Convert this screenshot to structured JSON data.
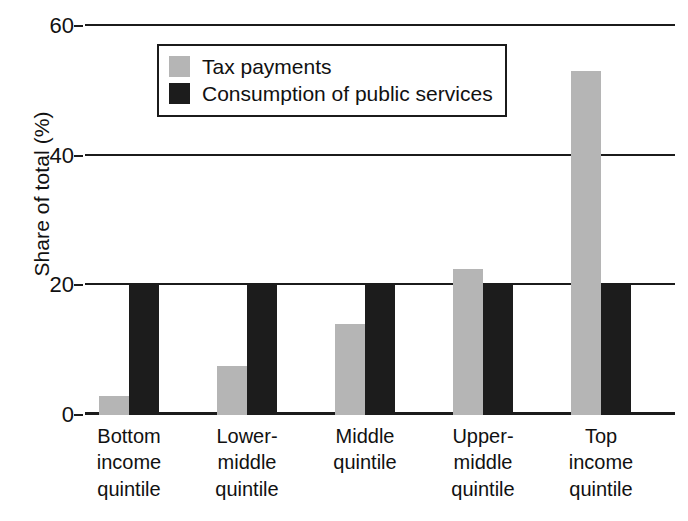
{
  "chart_data": {
    "type": "bar",
    "title": "",
    "subtitle": "",
    "xlabel": "",
    "ylabel": "Share of total (%)",
    "ylim": [
      0,
      60
    ],
    "yticks": [
      0,
      20,
      40,
      60
    ],
    "ytick_labels": [
      "0",
      "20",
      "40",
      "60"
    ],
    "grid": true,
    "grid_axis": "y",
    "legend_position": "upper-left-inside",
    "categories": [
      "Bottom\nincome\nquintile",
      "Lower-\nmiddle\nquintile",
      "Middle\nquintile",
      "Upper-\nmiddle\nquintile",
      "Top\nincome\nquintile"
    ],
    "category_lines": [
      [
        "Bottom",
        "income",
        "quintile"
      ],
      [
        "Lower-",
        "middle",
        "quintile"
      ],
      [
        "Middle",
        "quintile"
      ],
      [
        "Upper-",
        "middle",
        "quintile"
      ],
      [
        "Top",
        "income",
        "quintile"
      ]
    ],
    "series": [
      {
        "name": "Tax payments",
        "color": "#b5b5b5",
        "values": [
          3,
          7.5,
          14,
          22.5,
          53
        ]
      },
      {
        "name": "Consumption of public services",
        "color": "#1c1c1c",
        "values": [
          20,
          20,
          20,
          20,
          20
        ]
      }
    ]
  },
  "axis": {
    "y_title": "Share of total (%)"
  },
  "legend": {
    "items": [
      {
        "label": "Tax payments",
        "swatch": "gray-swatch"
      },
      {
        "label": "Consumption of public services",
        "swatch": "black-swatch"
      }
    ]
  },
  "colors": {
    "tax_payments": "#b5b5b5",
    "consumption": "#1c1c1c",
    "axis": "#1b1b1b",
    "background": "#ffffff"
  }
}
